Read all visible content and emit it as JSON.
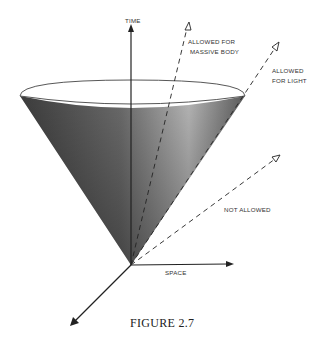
{
  "figure": {
    "caption": "FIGURE 2.7",
    "labels": {
      "time_axis": "TIME",
      "space_axis": "SPACE",
      "massive_body_line1": "ALLOWED FOR",
      "massive_body_line2": "MASSIVE BODY",
      "light_line1": "ALLOWED",
      "light_line2": "FOR LIGHT",
      "not_allowed": "NOT ALLOWED"
    },
    "colors": {
      "cone_dark": "#3a3a3a",
      "cone_light": "#b8b8b8",
      "rim_fill": "#ffffff",
      "axis": "#222222",
      "text": "#333333"
    }
  }
}
